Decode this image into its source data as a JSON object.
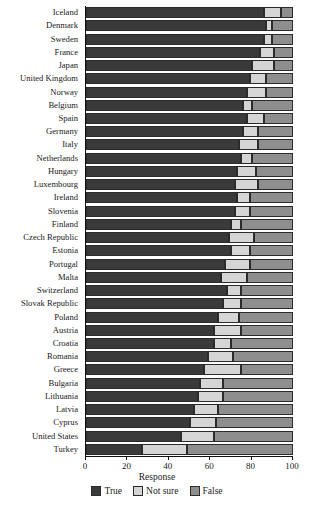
{
  "chart_data": {
    "type": "bar",
    "orientation": "horizontal",
    "stacked": true,
    "title": "",
    "xlabel": "Response",
    "ylabel": "",
    "xlim": [
      0,
      100
    ],
    "xticks": [
      0,
      20,
      40,
      60,
      80,
      100
    ],
    "grid": false,
    "legend_position": "bottom",
    "colors": {
      "True": "#3a3a3a",
      "Not sure": "#d5d5d5",
      "False": "#8e8e8e"
    },
    "categories": [
      "Iceland",
      "Denmark",
      "Sweden",
      "France",
      "Japan",
      "United Kingdom",
      "Norway",
      "Belgium",
      "Spain",
      "Germany",
      "Italy",
      "Netherlands",
      "Hungary",
      "Luxembourg",
      "Ireland",
      "Slovenia",
      "Finland",
      "Czech Republic",
      "Estonia",
      "Portugal",
      "Malta",
      "Switzerland",
      "Slovak Republic",
      "Poland",
      "Austria",
      "Croatia",
      "Romania",
      "Greece",
      "Bulgaria",
      "Lithuania",
      "Latvia",
      "Cyprus",
      "United States",
      "Turkey"
    ],
    "series": [
      {
        "name": "True",
        "values": [
          86,
          87,
          86,
          84,
          80,
          79,
          78,
          76,
          78,
          76,
          74,
          75,
          73,
          72,
          73,
          72,
          70,
          69,
          70,
          67,
          65,
          68,
          66,
          64,
          62,
          62,
          59,
          57,
          55,
          54,
          52,
          50,
          46,
          27
        ]
      },
      {
        "name": "Not sure",
        "values": [
          8,
          3,
          4,
          7,
          11,
          8,
          9,
          4,
          8,
          7,
          9,
          5,
          9,
          11,
          6,
          7,
          5,
          12,
          9,
          12,
          13,
          7,
          9,
          10,
          13,
          8,
          12,
          18,
          11,
          12,
          12,
          13,
          16,
          22
        ]
      },
      {
        "name": "False",
        "values": [
          6,
          10,
          10,
          9,
          9,
          13,
          13,
          20,
          14,
          17,
          17,
          20,
          18,
          17,
          21,
          21,
          25,
          19,
          21,
          21,
          22,
          25,
          25,
          26,
          25,
          30,
          29,
          25,
          34,
          34,
          36,
          37,
          38,
          51
        ]
      }
    ]
  },
  "axis": {
    "tick_labels": [
      "0",
      "20",
      "40",
      "60",
      "80",
      "100"
    ],
    "title": "Response"
  },
  "legend": {
    "items": [
      {
        "label": "True",
        "color": "#3a3a3a",
        "icon": "legend-swatch-true"
      },
      {
        "label": "Not sure",
        "color": "#d5d5d5",
        "icon": "legend-swatch-notsure"
      },
      {
        "label": "False",
        "color": "#8e8e8e",
        "icon": "legend-swatch-false"
      }
    ]
  }
}
